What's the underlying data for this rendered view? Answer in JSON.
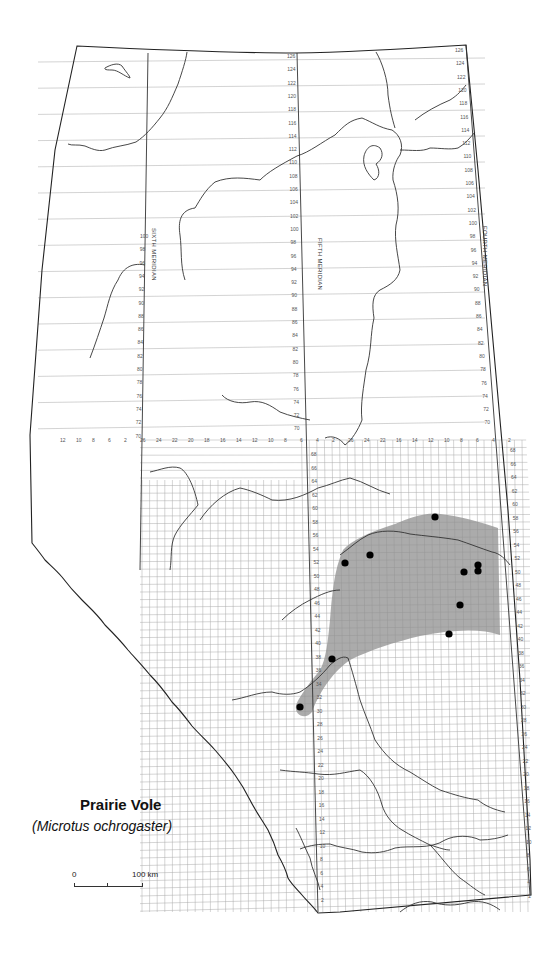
{
  "map": {
    "title": "Prairie Vole",
    "scientific_name": "(Microtus ochrogaster)",
    "scale_bar": {
      "start_label": "0",
      "end_label": "100 km"
    },
    "meridians": [
      {
        "name": "SIXTH MERIDIAN",
        "label": "SIXTH MERIDIAN"
      },
      {
        "name": "FIFTH MERIDIAN",
        "label": "FIFTH MERIDIAN"
      },
      {
        "name": "FOURTH MERIDIAN",
        "label": "FOURTH MERIDIAN"
      }
    ],
    "township_labels_north": [
      "126",
      "124",
      "122",
      "120",
      "118",
      "116",
      "114",
      "112",
      "110",
      "108",
      "106",
      "104",
      "102",
      "100",
      "98",
      "96",
      "94",
      "92",
      "90",
      "88",
      "86",
      "84",
      "82",
      "80",
      "78",
      "76",
      "74",
      "72",
      "70"
    ],
    "township_labels_south": [
      "68",
      "66",
      "64",
      "62",
      "60",
      "58",
      "56",
      "54",
      "52",
      "50",
      "48",
      "46",
      "44",
      "42",
      "40",
      "38",
      "36",
      "34",
      "32",
      "30",
      "28",
      "26",
      "24",
      "22",
      "20",
      "18",
      "16",
      "14",
      "12",
      "10",
      "8",
      "6",
      "4",
      "2"
    ],
    "range_labels_row": [
      "12",
      "10",
      "8",
      "6",
      "2",
      "26",
      "24",
      "22",
      "20",
      "18",
      "16",
      "14",
      "12",
      "10",
      "8",
      "6",
      "4",
      "2",
      "26",
      "24",
      "22",
      "16",
      "14",
      "12",
      "10",
      "8",
      "6",
      "4",
      "2"
    ],
    "colors": {
      "range_fill": "#8f8f8f",
      "record_dot": "#000000",
      "border": "#222222",
      "grid": "#b5b5b5"
    },
    "legend": {
      "shaded_area": "species range",
      "dots": "specimen records"
    },
    "records": [
      {
        "x": 435,
        "y": 517
      },
      {
        "x": 370,
        "y": 555
      },
      {
        "x": 345,
        "y": 563
      },
      {
        "x": 478,
        "y": 565
      },
      {
        "x": 478,
        "y": 571
      },
      {
        "x": 464,
        "y": 572
      },
      {
        "x": 460,
        "y": 605
      },
      {
        "x": 449,
        "y": 634
      },
      {
        "x": 332,
        "y": 659
      },
      {
        "x": 300,
        "y": 707
      }
    ]
  }
}
